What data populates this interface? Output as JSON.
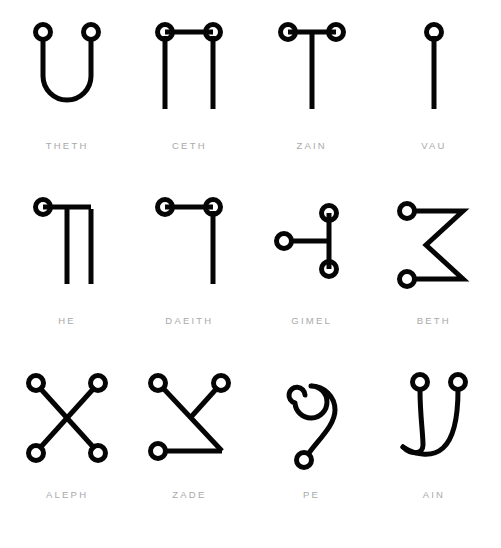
{
  "page": {
    "background_color": "#ffffff",
    "ink_color": "#050505",
    "label_color": "#a9a9a9",
    "columns": 4,
    "rows": 3
  },
  "glyphs": [
    {
      "label": "THETH",
      "icon_name": "glyph-theth",
      "description": "U-shaped curve with a ring terminal at each upper end"
    },
    {
      "label": "CETH",
      "icon_name": "glyph-ceth",
      "description": "Horizontal bar with rings at both ends and two verticals descending"
    },
    {
      "label": "ZAIN",
      "icon_name": "glyph-zain",
      "description": "T shape, horizontal bar with rings at both ends, central vertical stem"
    },
    {
      "label": "VAU",
      "icon_name": "glyph-vau",
      "description": "Single vertical stem topped with one ring"
    },
    {
      "label": "HE",
      "icon_name": "glyph-he",
      "description": "Ring at upper left, horizontal bar right, two verticals descending"
    },
    {
      "label": "DAEITH",
      "icon_name": "glyph-daeith",
      "description": "Horizontal bar with rings at both ends, vertical descending from right ring"
    },
    {
      "label": "GIMEL",
      "icon_name": "glyph-gimel",
      "description": "Vertical bar with rings top and bottom, horizontal branch left to a third ring"
    },
    {
      "label": "BETH",
      "icon_name": "glyph-beth",
      "description": "Zig-zag like a numeral three with rings at upper-left and lower-left"
    },
    {
      "label": "ALEPH",
      "icon_name": "glyph-aleph",
      "description": "Diagonal cross with four ring terminals"
    },
    {
      "label": "ZADE",
      "icon_name": "glyph-zade",
      "description": "Long diagonal with a short upper branch and a horizontal base, three rings"
    },
    {
      "label": "PE",
      "icon_name": "glyph-pe",
      "description": "Inward spiral curling to a descending tail ending in a small ring"
    },
    {
      "label": "AIN",
      "icon_name": "glyph-ain",
      "description": "Two ringed stems sweeping into a shared curve at the base"
    }
  ]
}
